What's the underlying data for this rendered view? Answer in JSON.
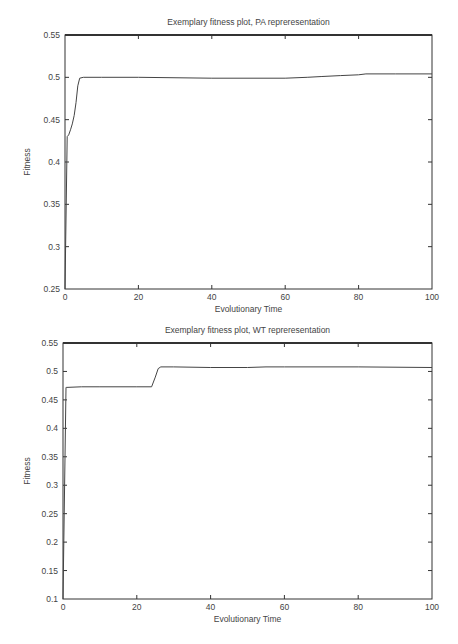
{
  "chart_data": [
    {
      "type": "line",
      "title": "Exemplary fitness plot, PA repreresentation",
      "xlabel": "Evolutionary Time",
      "ylabel": "Fitness",
      "xlim": [
        0,
        100
      ],
      "ylim": [
        0.25,
        0.55
      ],
      "xticks": [
        0,
        20,
        40,
        60,
        80,
        100
      ],
      "yticks": [
        0.25,
        0.3,
        0.35,
        0.4,
        0.45,
        0.5,
        0.55
      ],
      "xtick_labels": [
        "0",
        "20",
        "40",
        "60",
        "80",
        "100"
      ],
      "ytick_labels": [
        "0.25",
        "0.3",
        "0.35",
        "0.4",
        "0.45",
        "0.5",
        "0.55"
      ],
      "grid": false,
      "series": [
        {
          "name": "fitness",
          "x": [
            0,
            0.6,
            1,
            1.5,
            2,
            2.5,
            3,
            3.5,
            4,
            5,
            10,
            20,
            40,
            60,
            66,
            70,
            75,
            80,
            82,
            90,
            100
          ],
          "y": [
            0.25,
            0.43,
            0.432,
            0.438,
            0.445,
            0.455,
            0.47,
            0.49,
            0.499,
            0.5,
            0.5,
            0.5,
            0.499,
            0.499,
            0.5,
            0.501,
            0.502,
            0.503,
            0.504,
            0.504,
            0.504
          ]
        }
      ]
    },
    {
      "type": "line",
      "title": "Exemplary fitness plot, WT repreresentation",
      "xlabel": "Evolutionary Time",
      "ylabel": "Fitness",
      "xlim": [
        0,
        100
      ],
      "ylim": [
        0.1,
        0.55
      ],
      "xticks": [
        0,
        20,
        40,
        60,
        80,
        100
      ],
      "yticks": [
        0.1,
        0.15,
        0.2,
        0.25,
        0.3,
        0.35,
        0.4,
        0.45,
        0.5,
        0.55
      ],
      "xtick_labels": [
        "0",
        "20",
        "40",
        "60",
        "80",
        "100"
      ],
      "ytick_labels": [
        "0.1",
        "0.15",
        "0.2",
        "0.25",
        "0.3",
        "0.35",
        "0.4",
        "0.45",
        "0.5",
        "0.55"
      ],
      "grid": false,
      "series": [
        {
          "name": "fitness",
          "x": [
            0,
            0.8,
            1,
            5,
            10,
            20,
            24,
            25,
            25.8,
            26.5,
            30,
            40,
            50,
            55,
            60,
            80,
            100
          ],
          "y": [
            0.1,
            0.472,
            0.472,
            0.473,
            0.473,
            0.473,
            0.473,
            0.49,
            0.505,
            0.508,
            0.508,
            0.507,
            0.507,
            0.508,
            0.508,
            0.508,
            0.507
          ]
        }
      ]
    }
  ]
}
